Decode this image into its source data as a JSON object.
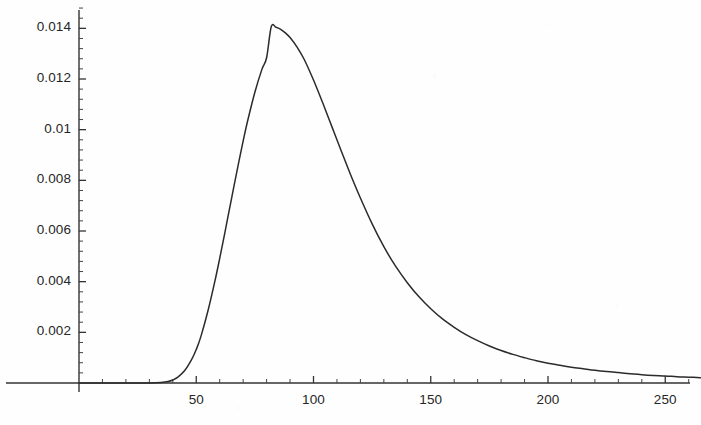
{
  "figure": {
    "background_color": "#fefefe",
    "ink_color": "#2b2b2b",
    "axis_color": "#333333"
  },
  "axes": {
    "origin_px": {
      "x": 79,
      "y": 383
    },
    "x_per_unit_px": 2.345,
    "y_per_unit_px": 25333,
    "y_tick_labels": [
      "0.014",
      "0.012",
      "0.01",
      "0.008",
      "0.006",
      "0.004",
      "0.002"
    ],
    "x_tick_labels": [
      "50",
      "100",
      "150",
      "200",
      "250"
    ]
  },
  "chart_data": {
    "type": "line",
    "title": "",
    "subtitle": "",
    "xlabel": "",
    "ylabel": "",
    "xlim": [
      0,
      265
    ],
    "ylim": [
      0,
      0.0151
    ],
    "grid": false,
    "legend": false,
    "legend_position": "none",
    "x_ticks": [
      50,
      100,
      150,
      200,
      250
    ],
    "y_ticks": [
      0.002,
      0.004,
      0.006,
      0.008,
      0.01,
      0.012,
      0.014
    ],
    "x_minor_tick_step": 10,
    "y_minor_tick_step": 0.0004,
    "annotations": [],
    "series": [
      {
        "name": "density",
        "x": [
          0,
          5,
          10,
          15,
          20,
          25,
          30,
          35,
          38,
          40,
          42,
          45,
          48,
          50,
          52,
          55,
          58,
          60,
          62,
          65,
          68,
          70,
          72,
          75,
          78,
          80,
          82,
          84,
          86,
          88,
          90,
          93,
          96,
          100,
          104,
          108,
          112,
          116,
          120,
          125,
          130,
          135,
          140,
          145,
          150,
          155,
          160,
          165,
          170,
          175,
          180,
          185,
          190,
          195,
          200,
          205,
          210,
          215,
          220,
          225,
          230,
          235,
          240,
          245,
          250,
          255,
          260,
          265
        ],
        "y": [
          0,
          0,
          0,
          0,
          0,
          0,
          0,
          2e-05,
          6e-05,
          0.00012,
          0.00022,
          0.00048,
          0.00092,
          0.00132,
          0.00184,
          0.00285,
          0.00404,
          0.00492,
          0.00584,
          0.00726,
          0.00866,
          0.00955,
          0.01038,
          0.01148,
          0.01238,
          0.01284,
          0.01407,
          0.01404,
          0.01396,
          0.01382,
          0.01364,
          0.01326,
          0.01278,
          0.01196,
          0.01104,
          0.01008,
          0.00912,
          0.00818,
          0.0073,
          0.00628,
          0.00538,
          0.00461,
          0.00396,
          0.0034,
          0.00293,
          0.00253,
          0.0022,
          0.00191,
          0.00167,
          0.00146,
          0.00128,
          0.00113,
          0.001,
          0.00088,
          0.00078,
          0.0007,
          0.00062,
          0.00056,
          0.0005,
          0.00045,
          0.00041,
          0.00037,
          0.00033,
          0.0003,
          0.00028,
          0.00025,
          0.00023,
          0.00021
        ]
      }
    ]
  }
}
